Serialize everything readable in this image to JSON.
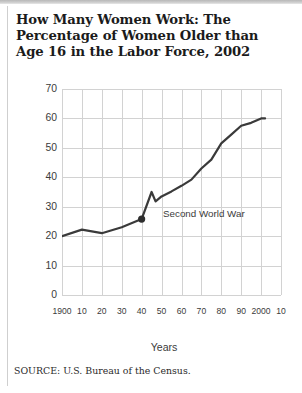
{
  "title": "How Many Women Work: The Percentage of Women Older than Age 16 in the Labor Force, 2002",
  "source": "SOURCE: U.S. Bureau of the Census.",
  "annotation": "Second World War",
  "chart_data": {
    "type": "line",
    "title": "How Many Women Work: The Percentage of Women Older than Age 16 in the Labor Force, 2002",
    "xlabel": "Years",
    "ylabel": "Percentage",
    "xlim": [
      1900,
      2010
    ],
    "ylim": [
      0,
      70
    ],
    "yticks": [
      0,
      10,
      20,
      30,
      40,
      50,
      60,
      70
    ],
    "ytick_labels": [
      "0",
      "10",
      "20",
      "30",
      "40",
      "50",
      "60",
      "70"
    ],
    "xticks": [
      1900,
      1910,
      1920,
      1930,
      1940,
      1950,
      1960,
      1970,
      1980,
      1990,
      2000,
      2010
    ],
    "xtick_labels": [
      "1900",
      "10",
      "20",
      "30",
      "40",
      "50",
      "60",
      "70",
      "80",
      "90",
      "2000",
      "10"
    ],
    "grid": true,
    "legend": false,
    "line_color": "#3a3a3a",
    "x": [
      1900,
      1910,
      1920,
      1930,
      1940,
      1945,
      1947,
      1950,
      1955,
      1960,
      1965,
      1970,
      1975,
      1980,
      1985,
      1990,
      1995,
      2000,
      2002
    ],
    "values": [
      20.0,
      22.2,
      21.0,
      23.0,
      25.8,
      35.0,
      31.8,
      33.5,
      35.2,
      37.1,
      39.2,
      43.0,
      46.0,
      51.5,
      54.5,
      57.5,
      58.5,
      60.0,
      60.0
    ],
    "annotations": [
      {
        "text": "Second World War",
        "x": 1940,
        "y": 25.8,
        "marker": true
      }
    ]
  }
}
